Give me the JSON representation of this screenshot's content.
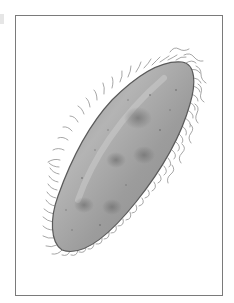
{
  "figure": {
    "colors": {
      "frame": "#7a7a7a",
      "body_fill": "#9a9a9a",
      "body_highlight": "#c8c8c8",
      "body_outline": "#5a5a5a",
      "cilia": "#8a8a8a",
      "spots": "#6e6e6e",
      "background": "#ffffff"
    }
  }
}
